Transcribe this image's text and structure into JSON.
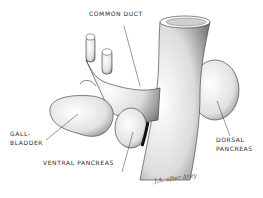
{
  "diagram": {
    "labels": {
      "common_duct": "COMMON DUCT",
      "gallbladder_line1": "GALL-",
      "gallbladder_line2": "BLADDER",
      "ventral_pancreas": "VENTRAL PANCREAS",
      "dorsal_line1": "DORSAL",
      "dorsal_line2": "PANCREAS"
    },
    "signature": "J.A. after Arey",
    "colors": {
      "ink": "#2a2a2a",
      "shade": "#8a8a8a",
      "background": "#ffffff"
    }
  }
}
